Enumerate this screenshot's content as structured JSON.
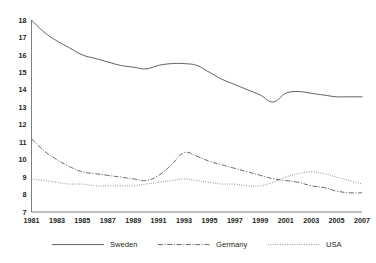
{
  "chart_data": {
    "type": "line",
    "title": "",
    "xlabel": "",
    "ylabel": "",
    "xlim": [
      1981,
      2007
    ],
    "ylim": [
      7,
      18
    ],
    "grid": false,
    "legend_position": "bottom",
    "x_tick_labels": [
      "1981",
      "1983",
      "1985",
      "1987",
      "1989",
      "1991",
      "1993",
      "1995",
      "1997",
      "1999",
      "2001",
      "2003",
      "2005",
      "2007"
    ],
    "x_ticks": [
      1981,
      1983,
      1985,
      1987,
      1989,
      1991,
      1993,
      1995,
      1997,
      1999,
      2001,
      2003,
      2005,
      2007
    ],
    "y_tick_labels": [
      "18",
      "17",
      "16",
      "15",
      "14",
      "13",
      "12",
      "11",
      "10",
      "9",
      "8",
      "7"
    ],
    "y_ticks": [
      18,
      17,
      16,
      15,
      14,
      13,
      12,
      11,
      10,
      9,
      8,
      7
    ],
    "x": [
      1981,
      1982,
      1983,
      1984,
      1985,
      1986,
      1987,
      1988,
      1989,
      1990,
      1991,
      1992,
      1993,
      1994,
      1995,
      1996,
      1997,
      1998,
      1999,
      2000,
      2001,
      2002,
      2003,
      2004,
      2005,
      2006,
      2007
    ],
    "series": [
      {
        "name": "Sweden",
        "style": "solid",
        "color": "#58585a",
        "values": [
          18.0,
          17.3,
          16.8,
          16.4,
          16.0,
          15.8,
          15.6,
          15.4,
          15.3,
          15.2,
          15.4,
          15.5,
          15.5,
          15.4,
          15.0,
          14.6,
          14.3,
          14.0,
          13.7,
          13.3,
          13.8,
          13.9,
          13.8,
          13.7,
          13.6,
          13.6,
          13.6
        ]
      },
      {
        "name": "Germany",
        "style": "dash-dot",
        "color": "#58585a",
        "values": [
          11.2,
          10.5,
          10.0,
          9.6,
          9.3,
          9.2,
          9.1,
          9.0,
          8.9,
          8.8,
          9.1,
          9.7,
          10.4,
          10.2,
          9.9,
          9.7,
          9.5,
          9.3,
          9.1,
          8.9,
          8.8,
          8.7,
          8.5,
          8.4,
          8.2,
          8.1,
          8.1
        ]
      },
      {
        "name": "USA",
        "style": "dotted",
        "color": "#7a7a7c",
        "values": [
          8.9,
          8.8,
          8.7,
          8.6,
          8.6,
          8.5,
          8.5,
          8.5,
          8.5,
          8.6,
          8.7,
          8.8,
          8.9,
          8.8,
          8.7,
          8.6,
          8.6,
          8.5,
          8.5,
          8.7,
          9.0,
          9.2,
          9.3,
          9.2,
          9.0,
          8.8,
          8.6
        ]
      }
    ],
    "legend": [
      {
        "label": "Sweden",
        "style": "solid"
      },
      {
        "label": "Germany",
        "style": "dash-dot"
      },
      {
        "label": "USA",
        "style": "dotted"
      }
    ]
  }
}
